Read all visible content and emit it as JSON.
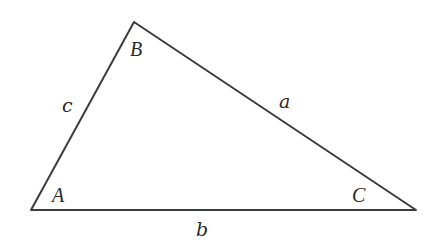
{
  "diagram": {
    "type": "triangle",
    "stroke_color": "#3c3c3c",
    "vertices": [
      {
        "name": "A",
        "label": "A",
        "x": 31,
        "y": 210,
        "label_x": 52,
        "label_y": 202
      },
      {
        "name": "B",
        "label": "B",
        "x": 134,
        "y": 22,
        "label_x": 130,
        "label_y": 56
      },
      {
        "name": "C",
        "label": "C",
        "x": 416,
        "y": 210,
        "label_x": 352,
        "label_y": 202
      }
    ],
    "sides": [
      {
        "name": "a",
        "label": "a",
        "from": "B",
        "to": "C",
        "label_x": 279,
        "label_y": 108
      },
      {
        "name": "b",
        "label": "b",
        "from": "A",
        "to": "C",
        "label_x": 196,
        "label_y": 236
      },
      {
        "name": "c",
        "label": "c",
        "from": "A",
        "to": "B",
        "label_x": 62,
        "label_y": 112
      }
    ]
  }
}
